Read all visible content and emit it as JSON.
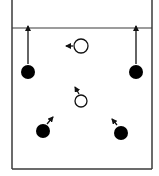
{
  "diagram": {
    "type": "play-diagram",
    "court": {
      "left_x": 12,
      "right_x": 152,
      "top_y": 0,
      "bottom_y": 169,
      "baseline_y": 28,
      "line_color": "#3a3a3a"
    },
    "players": [
      {
        "id": "p1",
        "kind": "filled",
        "x": 28,
        "y": 72,
        "r": 7
      },
      {
        "id": "p2",
        "kind": "filled",
        "x": 136,
        "y": 72,
        "r": 7
      },
      {
        "id": "p3",
        "kind": "filled",
        "x": 43,
        "y": 131,
        "r": 7
      },
      {
        "id": "p4",
        "kind": "filled",
        "x": 121,
        "y": 133,
        "r": 7
      },
      {
        "id": "p5",
        "kind": "hollow",
        "x": 81,
        "y": 46,
        "r": 7
      },
      {
        "id": "p6",
        "kind": "hollow",
        "x": 81,
        "y": 101,
        "r": 6
      }
    ],
    "arrows": [
      {
        "id": "a1",
        "x1": 28,
        "y1": 64,
        "x2": 28,
        "y2": 26
      },
      {
        "id": "a2",
        "x1": 136,
        "y1": 64,
        "x2": 136,
        "y2": 26
      },
      {
        "id": "a3",
        "x1": 73,
        "y1": 46,
        "x2": 66,
        "y2": 46
      },
      {
        "id": "a4",
        "x1": 79,
        "y1": 94,
        "x2": 75,
        "y2": 87
      },
      {
        "id": "a5",
        "x1": 47,
        "y1": 124,
        "x2": 53,
        "y2": 117
      },
      {
        "id": "a6",
        "x1": 117,
        "y1": 125,
        "x2": 112,
        "y2": 119
      }
    ],
    "colors": {
      "fill": "#000000",
      "stroke": "#111111",
      "background": "#ffffff"
    }
  }
}
